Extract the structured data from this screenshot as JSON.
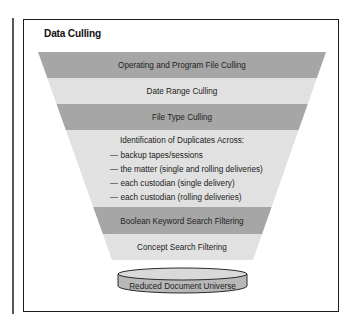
{
  "figure": {
    "title": "Data Culling",
    "colors": {
      "band_dark": "#a6a6a6",
      "band_light": "#e1e1e1",
      "frame": "#1a1a1a",
      "text": "#222222",
      "disk_top": "#d9d9d9",
      "disk_side": "#b8b8b8"
    }
  },
  "funnel": {
    "stages": [
      {
        "label": "Operating and Program File Culling",
        "shade": "dark"
      },
      {
        "label": "Date Range Culling",
        "shade": "light"
      },
      {
        "label": "File Type Culling",
        "shade": "dark"
      },
      {
        "label": "Identification of Duplicates Across:",
        "shade": "light",
        "items": [
          "— backup tapes/sessions",
          "— the matter (single and rolling deliveries)",
          "— each custodian (single delivery)",
          "— each custodian (rolling deliveries)"
        ]
      },
      {
        "label": "Boolean Keyword Search Filtering",
        "shade": "dark"
      },
      {
        "label": "Concept Search Filtering",
        "shade": "light"
      }
    ]
  },
  "output": {
    "label": "Reduced Document Universe",
    "icon": "database-disk-icon"
  }
}
